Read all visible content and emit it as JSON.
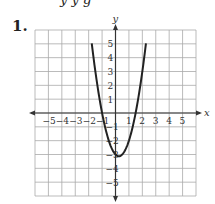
{
  "header": {
    "partial_text": "y  y  g",
    "problem_number": "1."
  },
  "chart_data": {
    "type": "line",
    "title": "",
    "xlabel": "x",
    "ylabel": "y",
    "xlim": [
      -6,
      6
    ],
    "ylim": [
      -6,
      6
    ],
    "grid": true,
    "x_ticks": [
      "−5",
      "−4",
      "−3",
      "−2",
      "−1",
      "1",
      "2",
      "3",
      "4",
      "5"
    ],
    "y_ticks": [
      "5",
      "4",
      "3",
      "2",
      "1",
      "−1",
      "−2",
      "−3",
      "−4",
      "−5"
    ],
    "series": [
      {
        "name": "parabola",
        "equation_estimate": "y = 2x^2 - x - 3",
        "x": [
          -1.77,
          -1.5,
          -1.0,
          -0.5,
          0.0,
          0.25,
          0.5,
          1.0,
          1.5,
          2.0,
          2.27
        ],
        "y": [
          5.0,
          3.0,
          0.0,
          -2.0,
          -3.0,
          -3.125,
          -3.0,
          -2.0,
          0.0,
          3.0,
          5.0
        ]
      }
    ],
    "colors": {
      "curve": "#222222",
      "grid": "#aaaaaa",
      "axes": "#333333"
    }
  }
}
